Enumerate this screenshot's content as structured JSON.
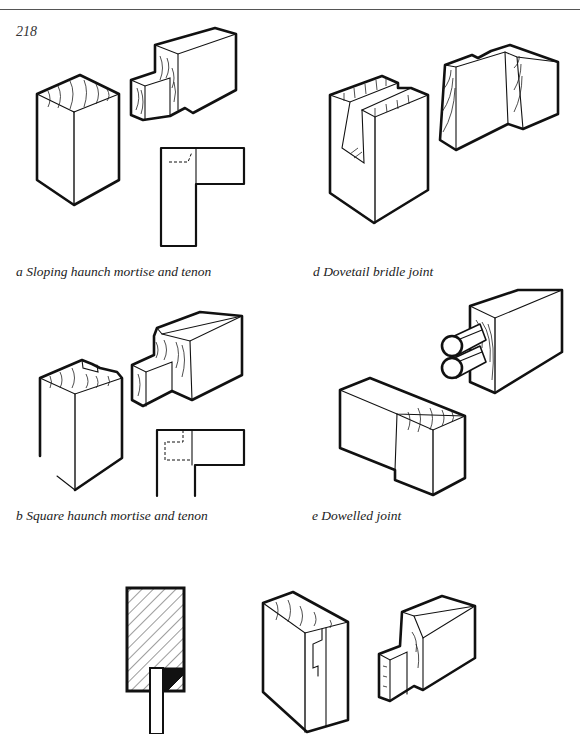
{
  "page": {
    "page_number": "218",
    "header_rule": true
  },
  "figures": [
    {
      "id": "a",
      "caption": "a Sloping haunch mortise and tenon"
    },
    {
      "id": "d",
      "caption": "d Dovetail bridle joint"
    },
    {
      "id": "b",
      "caption": "b Square haunch mortise and tenon"
    },
    {
      "id": "e",
      "caption": "e Dowelled joint"
    },
    {
      "id": "c",
      "caption": ""
    }
  ]
}
